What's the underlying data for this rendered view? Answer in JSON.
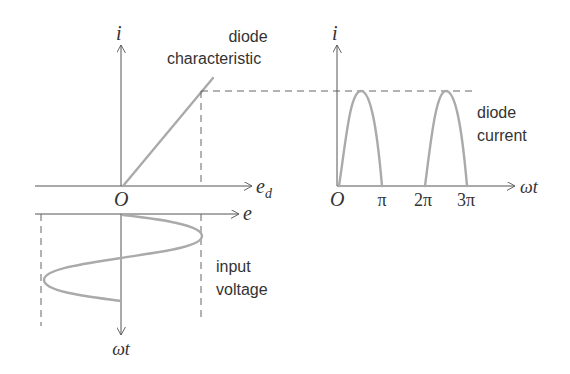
{
  "diagram": {
    "colors": {
      "axis": "#555555",
      "curve": "#aaaaaa",
      "dashed": "#666666",
      "text": "#333333"
    },
    "left_panel": {
      "y_axis_label": "i",
      "x_axis_label": "e",
      "x_axis_subscript": "d",
      "origin_label": "O",
      "characteristic_label_line1": "diode",
      "characteristic_label_line2": "characteristic"
    },
    "input_panel": {
      "x_axis_label": "e",
      "time_axis_label": "ωt",
      "input_label_line1": "input",
      "input_label_line2": "voltage"
    },
    "right_panel": {
      "y_axis_label": "i",
      "x_axis_label": "ωt",
      "origin_label": "O",
      "tick_labels": [
        "π",
        "2π",
        "3π"
      ],
      "current_label_line1": "diode",
      "current_label_line2": "current"
    }
  }
}
